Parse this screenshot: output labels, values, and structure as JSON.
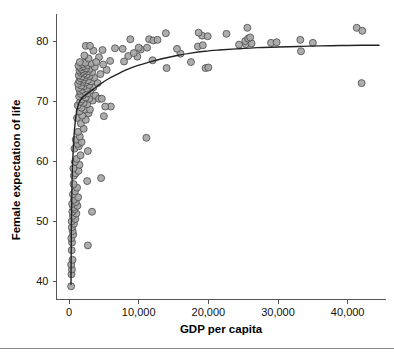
{
  "figure": {
    "background_color": "#ffffff",
    "marker_fill": "#a6a6a6",
    "marker_stroke": "#4a4a4a",
    "line_color": "#222222",
    "axis_color": "#555555"
  },
  "axes": {
    "x_title": "GDP per capita",
    "y_title": "Female expectation of life",
    "x_ticks": [
      "0",
      "10,000",
      "20,000",
      "30,000",
      "40,000"
    ],
    "y_ticks": [
      "40",
      "50",
      "60",
      "70",
      "80"
    ]
  },
  "chart_data": {
    "type": "scatter",
    "title": "",
    "xlabel": "GDP per capita",
    "ylabel": "Female expectation of life",
    "xlim": [
      -1800,
      45500
    ],
    "ylim": [
      37.0,
      84.5
    ],
    "xticks": [
      0,
      10000,
      20000,
      30000,
      40000
    ],
    "xticklabels": [
      "0",
      "10,000",
      "20,000",
      "30,000",
      "40,000"
    ],
    "yticks": [
      40,
      50,
      60,
      70,
      80
    ],
    "yticklabels": [
      "40",
      "50",
      "60",
      "70",
      "80"
    ],
    "grid": false,
    "legend": null,
    "marker": {
      "shape": "circle",
      "size_px": 7,
      "fill": "#a6a6a6",
      "edge": "#4a4a4a"
    },
    "series": [
      {
        "name": "Countries",
        "type": "scatter",
        "points": [
          [
            300,
            39.2
          ],
          [
            350,
            41.2
          ],
          [
            420,
            42.0
          ],
          [
            300,
            42.8
          ],
          [
            500,
            43.6
          ],
          [
            380,
            45.2
          ],
          [
            2700,
            46.0
          ],
          [
            430,
            46.5
          ],
          [
            330,
            47.2
          ],
          [
            600,
            47.8
          ],
          [
            520,
            48.4
          ],
          [
            400,
            49.0
          ],
          [
            700,
            49.6
          ],
          [
            380,
            50.0
          ],
          [
            900,
            50.4
          ],
          [
            560,
            50.9
          ],
          [
            1050,
            51.3
          ],
          [
            470,
            51.6
          ],
          [
            3300,
            51.6
          ],
          [
            800,
            52.0
          ],
          [
            620,
            52.3
          ],
          [
            1200,
            52.6
          ],
          [
            450,
            52.9
          ],
          [
            980,
            53.2
          ],
          [
            700,
            53.6
          ],
          [
            1300,
            54.0
          ],
          [
            560,
            54.5
          ],
          [
            860,
            55.0
          ],
          [
            1150,
            55.6
          ],
          [
            640,
            56.2
          ],
          [
            2600,
            56.7
          ],
          [
            4600,
            57.2
          ],
          [
            700,
            57.6
          ],
          [
            950,
            58.0
          ],
          [
            1350,
            58.4
          ],
          [
            620,
            58.8
          ],
          [
            1500,
            59.4
          ],
          [
            840,
            59.9
          ],
          [
            1100,
            60.4
          ],
          [
            1650,
            61.0
          ],
          [
            2700,
            61.7
          ],
          [
            780,
            62.1
          ],
          [
            1400,
            62.5
          ],
          [
            1250,
            62.9
          ],
          [
            1800,
            63.2
          ],
          [
            960,
            63.6
          ],
          [
            11100,
            63.9
          ],
          [
            1550,
            64.1
          ],
          [
            1300,
            64.9
          ],
          [
            2100,
            65.4
          ],
          [
            1700,
            66.3
          ],
          [
            2400,
            66.9
          ],
          [
            1150,
            67.2
          ],
          [
            1900,
            67.6
          ],
          [
            5000,
            67.5
          ],
          [
            2800,
            68.0
          ],
          [
            1500,
            68.3
          ],
          [
            2300,
            68.6
          ],
          [
            3000,
            68.6
          ],
          [
            1800,
            68.9
          ],
          [
            6000,
            69.1
          ],
          [
            1250,
            69.3
          ],
          [
            2600,
            69.5
          ],
          [
            2100,
            69.7
          ],
          [
            1600,
            69.9
          ],
          [
            3400,
            70.1
          ],
          [
            1900,
            70.3
          ],
          [
            2900,
            70.4
          ],
          [
            2400,
            70.6
          ],
          [
            1450,
            70.8
          ],
          [
            3800,
            70.9
          ],
          [
            2000,
            71.0
          ],
          [
            1700,
            71.2
          ],
          [
            2700,
            71.3
          ],
          [
            4300,
            70.4
          ],
          [
            2250,
            71.5
          ],
          [
            1550,
            71.7
          ],
          [
            3100,
            71.8
          ],
          [
            1900,
            71.9
          ],
          [
            2550,
            72.1
          ],
          [
            1400,
            72.2
          ],
          [
            3500,
            72.3
          ],
          [
            2150,
            72.5
          ],
          [
            1750,
            72.6
          ],
          [
            2900,
            72.7
          ],
          [
            1300,
            72.9
          ],
          [
            4100,
            73.0
          ],
          [
            2400,
            73.1
          ],
          [
            1950,
            73.2
          ],
          [
            3200,
            73.3
          ],
          [
            1500,
            73.4
          ],
          [
            2700,
            73.5
          ],
          [
            2050,
            73.6
          ],
          [
            1650,
            73.8
          ],
          [
            3600,
            73.9
          ],
          [
            2350,
            74.0
          ],
          [
            1850,
            74.1
          ],
          [
            2950,
            74.2
          ],
          [
            1400,
            74.3
          ],
          [
            2550,
            74.4
          ],
          [
            4500,
            74.5
          ],
          [
            2150,
            74.6
          ],
          [
            1700,
            74.7
          ],
          [
            3300,
            74.8
          ],
          [
            1950,
            74.9
          ],
          [
            2750,
            75.0
          ],
          [
            1500,
            75.1
          ],
          [
            2300,
            75.2
          ],
          [
            5400,
            75.2
          ],
          [
            1800,
            75.3
          ],
          [
            3000,
            75.4
          ],
          [
            2450,
            75.5
          ],
          [
            1600,
            75.6
          ],
          [
            3700,
            75.7
          ],
          [
            2100,
            75.8
          ],
          [
            1350,
            75.9
          ],
          [
            2650,
            76.0
          ],
          [
            4900,
            76.1
          ],
          [
            1900,
            76.2
          ],
          [
            3200,
            76.3
          ],
          [
            2350,
            76.4
          ],
          [
            1550,
            76.5
          ],
          [
            19600,
            75.5
          ],
          [
            20000,
            75.6
          ],
          [
            17500,
            76.5
          ],
          [
            7900,
            76.6
          ],
          [
            5900,
            76.7
          ],
          [
            12000,
            76.8
          ],
          [
            14000,
            75.5
          ],
          [
            2800,
            77.1
          ],
          [
            4300,
            77.3
          ],
          [
            9800,
            77.4
          ],
          [
            8500,
            77.5
          ],
          [
            2200,
            77.6
          ],
          [
            16000,
            77.9
          ],
          [
            9300,
            78.0
          ],
          [
            33300,
            78.3
          ],
          [
            3500,
            78.4
          ],
          [
            4800,
            78.5
          ],
          [
            10300,
            78.6
          ],
          [
            7700,
            78.7
          ],
          [
            11200,
            78.9
          ],
          [
            15500,
            78.7
          ],
          [
            18500,
            79.1
          ],
          [
            19200,
            79.3
          ],
          [
            2400,
            79.2
          ],
          [
            24400,
            79.4
          ],
          [
            25400,
            79.5
          ],
          [
            26200,
            79.6
          ],
          [
            29000,
            79.7
          ],
          [
            29800,
            79.8
          ],
          [
            33200,
            80.2
          ],
          [
            35000,
            79.7
          ],
          [
            8800,
            80.3
          ],
          [
            11500,
            80.3
          ],
          [
            12100,
            80.1
          ],
          [
            12700,
            80.2
          ],
          [
            25300,
            80.0
          ],
          [
            25700,
            80.4
          ],
          [
            26000,
            80.6
          ],
          [
            19100,
            80.9
          ],
          [
            19900,
            80.8
          ],
          [
            22600,
            81.2
          ],
          [
            13900,
            81.3
          ],
          [
            18600,
            81.4
          ],
          [
            25600,
            82.2
          ],
          [
            41300,
            82.2
          ],
          [
            42100,
            81.7
          ],
          [
            42000,
            73.0
          ],
          [
            10000,
            78.9
          ],
          [
            6600,
            78.8
          ],
          [
            5200,
            69.1
          ],
          [
            4700,
            70.4
          ],
          [
            3900,
            76.5
          ],
          [
            3000,
            79.2
          ]
        ]
      }
    ],
    "fit_curve": {
      "name": "Lowess / logarithmic fit",
      "color": "#222222",
      "points": [
        [
          280,
          39.5
        ],
        [
          330,
          48.0
        ],
        [
          420,
          56.0
        ],
        [
          600,
          62.0
        ],
        [
          800,
          65.5
        ],
        [
          1000,
          67.6
        ],
        [
          1300,
          69.3
        ],
        [
          1700,
          70.3
        ],
        [
          2200,
          70.9
        ],
        [
          2800,
          71.4
        ],
        [
          3500,
          72.0
        ],
        [
          4400,
          72.8
        ],
        [
          5500,
          73.6
        ],
        [
          6800,
          74.4
        ],
        [
          8200,
          75.2
        ],
        [
          9800,
          75.9
        ],
        [
          11500,
          76.5
        ],
        [
          13500,
          77.1
        ],
        [
          15500,
          77.6
        ],
        [
          17500,
          78.0
        ],
        [
          19500,
          78.3
        ],
        [
          21500,
          78.5
        ],
        [
          24000,
          78.7
        ],
        [
          27000,
          78.9
        ],
        [
          30000,
          79.0
        ],
        [
          33000,
          79.1
        ],
        [
          36000,
          79.2
        ],
        [
          39000,
          79.25
        ],
        [
          42000,
          79.3
        ],
        [
          44500,
          79.3
        ]
      ]
    }
  }
}
